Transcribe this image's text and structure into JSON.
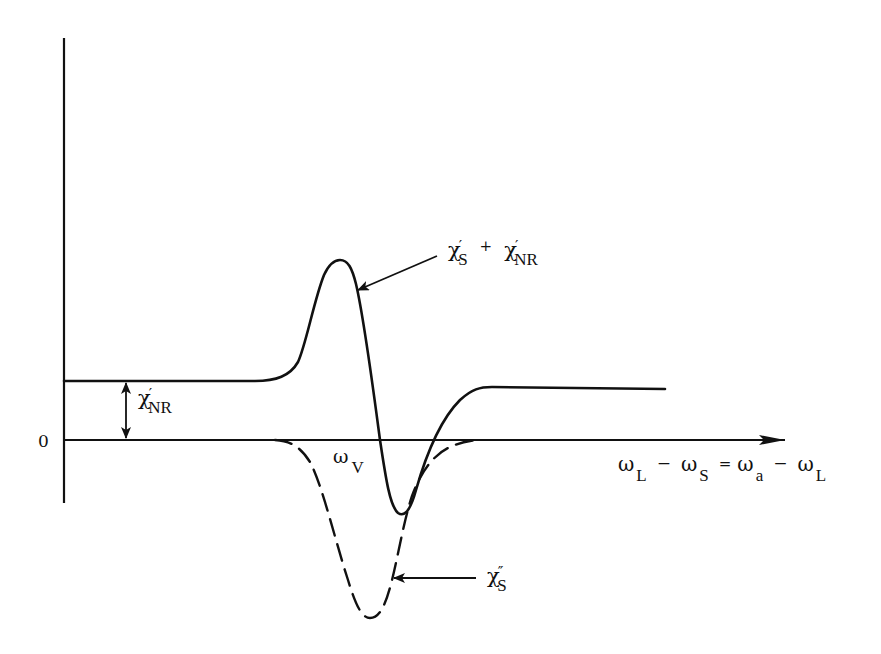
{
  "figure": {
    "type": "susceptibility-dispersion-diagram",
    "colors": {
      "ink": "#111111",
      "background": "#ffffff"
    },
    "y_axis": {
      "zero_label": "0"
    },
    "x_axis": {
      "label_parts": {
        "w1": "ω",
        "s1": "L",
        "minus1": "−",
        "w2": "ω",
        "s2": "S",
        "equals": "=",
        "w3": "ω",
        "s3": "a",
        "minus2": "−",
        "w4": "ω",
        "s4": "L"
      },
      "label_text": "ωL − ωS = ωa − ωL"
    },
    "annotations": {
      "resonance": {
        "symbol": "ω",
        "sub": "V",
        "text": "ωV"
      },
      "nonresonant": {
        "symbol": "χ",
        "prime": "′",
        "sub": "NR",
        "text": "χ′NR"
      },
      "total": {
        "a_symbol": "χ",
        "a_prime": "′",
        "a_sub": "S",
        "plus": "+",
        "b_symbol": "χ",
        "b_prime": "′",
        "b_sub": "NR",
        "text": "χ′S + χ′NR"
      },
      "imaginary": {
        "symbol": "χ",
        "prime": "″",
        "sub": "S",
        "text": "χ″S"
      }
    },
    "curves": [
      {
        "name": "real part total (χ′S + χ′NR)",
        "style": "solid"
      },
      {
        "name": "imaginary part (χ″S)",
        "style": "dashed"
      }
    ]
  }
}
